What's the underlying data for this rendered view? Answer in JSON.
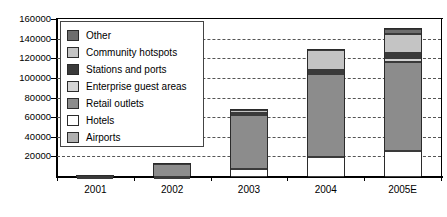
{
  "chart_data": {
    "type": "bar",
    "subtype": "stacked-column",
    "title": "",
    "xlabel": "",
    "ylabel": "",
    "categories": [
      "2001",
      "2002",
      "2003",
      "2004",
      "2005E"
    ],
    "ylim": [
      0,
      160000
    ],
    "ytick_interval": 20000,
    "ytick_labels": [
      "160000",
      "140000",
      "120000",
      "100000",
      "80000",
      "60000",
      "40000",
      "20000"
    ],
    "ytick_values": [
      160000,
      140000,
      120000,
      100000,
      80000,
      60000,
      40000,
      20000
    ],
    "grid": true,
    "grid_style": "dashed-horizontal",
    "legend_position": "upper-left-inside",
    "series": [
      {
        "name": "Hotels",
        "color": "#ffffff",
        "values": [
          200,
          300,
          8000,
          20000,
          26000
        ]
      },
      {
        "name": "Retail outlets",
        "color": "#8c8c8c",
        "values": [
          1000,
          13000,
          55000,
          85000,
          91000
        ]
      },
      {
        "name": "Enterprise guest areas",
        "color": "#d4d4d4",
        "values": [
          0,
          0,
          1500,
          2500,
          4000
        ]
      },
      {
        "name": "Stations and ports",
        "color": "#3a3a3a",
        "values": [
          0,
          0,
          800,
          2000,
          5000
        ]
      },
      {
        "name": "Community hotspots",
        "color": "#c4c4c4",
        "values": [
          0,
          0,
          2500,
          20000,
          20000
        ]
      },
      {
        "name": "Other",
        "color": "#6e6e6e",
        "values": [
          0,
          0,
          0,
          0,
          4500
        ]
      },
      {
        "name": "Airports",
        "color": "#b0b0b0",
        "values": [
          0,
          0,
          0,
          0,
          0
        ]
      }
    ],
    "stack_order_bottom_to_top": [
      "Hotels",
      "Retail outlets",
      "Enterprise guest areas",
      "Stations and ports",
      "Community hotspots",
      "Other"
    ],
    "totals": [
      1200,
      13300,
      67800,
      129500,
      150500
    ],
    "legend_entries": [
      {
        "label": "Other",
        "color": "#6e6e6e"
      },
      {
        "label": "Community hotspots",
        "color": "#c4c4c4"
      },
      {
        "label": "Stations and ports",
        "color": "#3a3a3a"
      },
      {
        "label": "Enterprise guest areas",
        "color": "#d4d4d4"
      },
      {
        "label": "Retail outlets",
        "color": "#8c8c8c"
      },
      {
        "label": "Hotels",
        "color": "#ffffff"
      },
      {
        "label": "Airports",
        "color": "#b0b0b0"
      }
    ]
  }
}
